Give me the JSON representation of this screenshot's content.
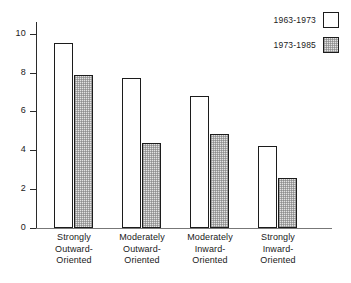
{
  "chart_data": {
    "type": "bar",
    "title": "",
    "xlabel": "",
    "ylabel": "",
    "ylim": [
      0,
      10.6
    ],
    "yticks": [
      0,
      2,
      4,
      6,
      8,
      10
    ],
    "ytick_labels": [
      "0",
      "2",
      "4",
      "6",
      "8",
      "10"
    ],
    "grid": false,
    "legend_position": "top-right",
    "categories": [
      "Strongly Outward-Oriented",
      "Moderately Outward-Oriented",
      "Moderately Inward-Oriented",
      "Strongly Inward-Oriented"
    ],
    "category_lines": [
      [
        "Strongly",
        "Outward-",
        "Oriented"
      ],
      [
        "Moderately",
        "Outward-",
        "Oriented"
      ],
      [
        "Moderately",
        "Inward-",
        "Oriented"
      ],
      [
        "Strongly",
        "Inward-",
        "Oriented"
      ]
    ],
    "series": [
      {
        "name": "1963-1973",
        "values": [
          9.5,
          7.7,
          6.8,
          4.2
        ],
        "fill": "#ffffff",
        "edge": "#1c1c1c"
      },
      {
        "name": "1973-1985",
        "values": [
          7.85,
          4.4,
          4.85,
          2.55
        ],
        "fill": "#e2e2e2",
        "edge": "#1c1c1c"
      }
    ]
  },
  "legend": {
    "entries": [
      {
        "label": "1963-1973",
        "swatch": "white-square-swatch"
      },
      {
        "label": "1973-1985",
        "swatch": "shaded-square-swatch"
      }
    ]
  },
  "axis": {
    "y_tick_labels": [
      "10",
      "8",
      "6",
      "4",
      "2",
      "0"
    ]
  }
}
